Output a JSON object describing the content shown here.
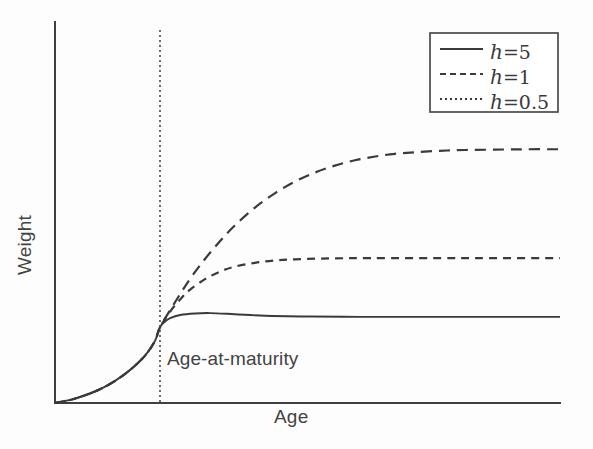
{
  "figure": {
    "background_color": "#fdfdfd",
    "line_color": "#3a3a3a",
    "axis_color": "#3f3f3f"
  },
  "axes": {
    "xlabel": "Age",
    "ylabel": "Weight",
    "x_origin_px": 55,
    "y_origin_px": 403,
    "x_end_px": 560,
    "y_top_px": 22,
    "ticks": [],
    "grid": false
  },
  "annotations": [
    {
      "name": "age-at-maturity",
      "text": "Age-at-maturity",
      "line_style": "dotted",
      "x_px": 160
    }
  ],
  "legend": {
    "position": "top-right",
    "border_color": "#4a4a4a",
    "entries": [
      {
        "symbol": "h",
        "operator": "=",
        "value": "5",
        "style": "solid",
        "label": "h = 5"
      },
      {
        "symbol": "h",
        "operator": "=",
        "value": "1",
        "style": "dashed",
        "label": "h = 1"
      },
      {
        "symbol": "h",
        "operator": "=",
        "value": "0.5",
        "style": "dotted",
        "label": "h = 0.5"
      }
    ]
  },
  "chart_data": {
    "type": "line",
    "title": "",
    "subtitle": "",
    "xlabel": "Age",
    "ylabel": "Weight",
    "xlim": [
      0,
      1
    ],
    "ylim": [
      0,
      1
    ],
    "grid": false,
    "legend_position": "top-right",
    "axis_ticks_labeled": false,
    "annotations": [
      "Age-at-maturity"
    ],
    "maturity_x": 0.208,
    "maturity_y": 0.199,
    "series": [
      {
        "name": "h = 5",
        "label": "h = 5",
        "style": "solid",
        "asymptote_y": 0.226,
        "peak_y": 0.236,
        "points": [
          [
            0.0,
            0.0
          ],
          [
            0.03,
            0.008
          ],
          [
            0.059,
            0.02
          ],
          [
            0.089,
            0.036
          ],
          [
            0.119,
            0.058
          ],
          [
            0.149,
            0.087
          ],
          [
            0.178,
            0.124
          ],
          [
            0.198,
            0.163
          ],
          [
            0.208,
            0.199
          ],
          [
            0.218,
            0.214
          ],
          [
            0.228,
            0.223
          ],
          [
            0.248,
            0.231
          ],
          [
            0.277,
            0.235
          ],
          [
            0.307,
            0.236
          ],
          [
            0.356,
            0.233
          ],
          [
            0.416,
            0.229
          ],
          [
            0.505,
            0.227
          ],
          [
            0.604,
            0.226
          ],
          [
            0.703,
            0.226
          ],
          [
            0.802,
            0.226
          ],
          [
            0.901,
            0.226
          ],
          [
            1.0,
            0.226
          ]
        ]
      },
      {
        "name": "h = 1",
        "label": "h = 1",
        "style": "dashed",
        "asymptote_y": 0.666,
        "points": [
          [
            0.0,
            0.0
          ],
          [
            0.03,
            0.008
          ],
          [
            0.059,
            0.02
          ],
          [
            0.089,
            0.036
          ],
          [
            0.119,
            0.058
          ],
          [
            0.149,
            0.087
          ],
          [
            0.178,
            0.124
          ],
          [
            0.198,
            0.163
          ],
          [
            0.208,
            0.199
          ],
          [
            0.238,
            0.265
          ],
          [
            0.267,
            0.325
          ],
          [
            0.297,
            0.378
          ],
          [
            0.327,
            0.425
          ],
          [
            0.356,
            0.466
          ],
          [
            0.396,
            0.513
          ],
          [
            0.436,
            0.551
          ],
          [
            0.475,
            0.581
          ],
          [
            0.515,
            0.605
          ],
          [
            0.554,
            0.623
          ],
          [
            0.594,
            0.637
          ],
          [
            0.634,
            0.647
          ],
          [
            0.673,
            0.654
          ],
          [
            0.713,
            0.658
          ],
          [
            0.762,
            0.662
          ],
          [
            0.812,
            0.664
          ],
          [
            0.871,
            0.665
          ],
          [
            0.931,
            0.666
          ],
          [
            1.0,
            0.666
          ]
        ]
      },
      {
        "name": "h = 0.5",
        "label": "h = 0.5",
        "style": "dotted",
        "asymptote_y": 0.38,
        "points": [
          [
            0.0,
            0.0
          ],
          [
            0.03,
            0.008
          ],
          [
            0.059,
            0.02
          ],
          [
            0.089,
            0.036
          ],
          [
            0.119,
            0.058
          ],
          [
            0.149,
            0.087
          ],
          [
            0.178,
            0.124
          ],
          [
            0.198,
            0.163
          ],
          [
            0.208,
            0.199
          ],
          [
            0.228,
            0.24
          ],
          [
            0.248,
            0.272
          ],
          [
            0.267,
            0.297
          ],
          [
            0.297,
            0.325
          ],
          [
            0.327,
            0.345
          ],
          [
            0.356,
            0.358
          ],
          [
            0.396,
            0.368
          ],
          [
            0.436,
            0.374
          ],
          [
            0.475,
            0.377
          ],
          [
            0.525,
            0.379
          ],
          [
            0.584,
            0.38
          ],
          [
            0.663,
            0.38
          ],
          [
            0.762,
            0.38
          ],
          [
            0.861,
            0.38
          ],
          [
            1.0,
            0.38
          ]
        ]
      }
    ]
  }
}
